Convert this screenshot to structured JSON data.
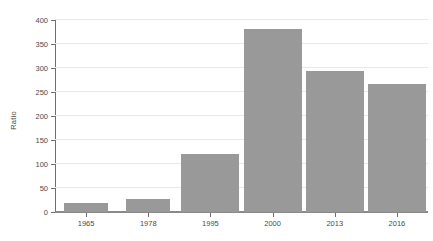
{
  "chart_data": {
    "type": "bar",
    "title": "",
    "subtitle": "",
    "xlabel": "",
    "ylabel": "Ratio",
    "categories": [
      "1965",
      "1978",
      "1995",
      "2000",
      "2013",
      "2016"
    ],
    "values": [
      18,
      28,
      121,
      381,
      293,
      267
    ],
    "series": [
      {
        "name": "Ratio",
        "values": [
          18,
          28,
          121,
          381,
          293,
          267
        ]
      }
    ],
    "ylim": [
      0,
      400
    ],
    "y_ticks": [
      0,
      50,
      100,
      150,
      200,
      250,
      300,
      350,
      400
    ],
    "y_tick_labels": [
      "0",
      "50",
      "100",
      "150",
      "200",
      "250",
      "300",
      "350",
      "400"
    ],
    "grid": "horizontal",
    "legend": "none",
    "bar_color": "#999999",
    "gridline_color": "#e8e8e8",
    "axis_color": "#6f6f6f",
    "text_color": "#4a4a4a",
    "background_color": "#ffffff"
  }
}
